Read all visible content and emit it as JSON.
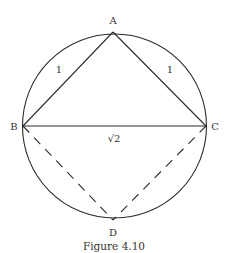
{
  "figure": {
    "caption": "Figure 4.10",
    "points": {
      "A": {
        "label": "A",
        "x": 113,
        "y": 32
      },
      "B": {
        "label": "B",
        "x": 23,
        "y": 126
      },
      "C": {
        "label": "C",
        "x": 206,
        "y": 126
      },
      "D": {
        "label": "D",
        "x": 113,
        "y": 220
      }
    },
    "circle": {
      "cx": 114.5,
      "cy": 126,
      "r": 92
    },
    "edge_labels": {
      "AB": "1",
      "AC": "1",
      "BC": "√2"
    },
    "colors": {
      "stroke": "#2b2b2b",
      "text": "#333333"
    }
  }
}
